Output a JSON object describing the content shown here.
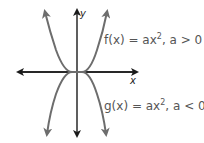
{
  "diagram": {
    "type": "graph of parabolas",
    "x_axis_label": "x",
    "y_axis_label": "y",
    "curves": [
      {
        "name": "f",
        "label_prefix": "f(x) = ax",
        "exponent": "2",
        "label_suffix": ", a > 0",
        "direction": "opens up",
        "color": "#6d6d6d"
      },
      {
        "name": "g",
        "label_prefix": "g(x) = ax",
        "exponent": "2",
        "label_suffix": ", a < 0",
        "direction": "opens down",
        "color": "#6d6d6d"
      }
    ],
    "axis_color": "#1a1a1a"
  }
}
